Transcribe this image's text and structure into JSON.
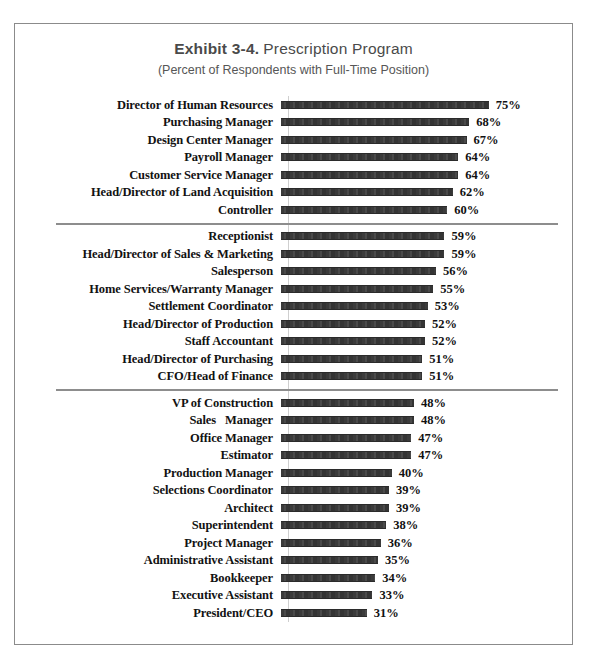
{
  "title": {
    "exhibit": "Exhibit 3-4.",
    "name": "Prescription Program",
    "subtitle": "(Percent of Respondents with Full-Time Position)"
  },
  "chart_data": {
    "type": "bar",
    "orientation": "horizontal",
    "subtitle": "(Percent of Respondents with Full-Time Position)",
    "xlabel": "",
    "ylabel": "",
    "xlim": [
      0,
      80
    ],
    "grid": false,
    "legend": "none",
    "value_suffix": "%",
    "group_separators_after": [
      6,
      15
    ],
    "categories": [
      "Director of Human Resources",
      "Purchasing Manager",
      "Design Center Manager",
      "Payroll Manager",
      "Customer Service Manager",
      "Head/Director of Land Acquisition",
      "Controller",
      "Receptionist",
      "Head/Director of Sales & Marketing",
      "Salesperson",
      "Home Services/Warranty Manager",
      "Settlement Coordinator",
      "Head/Director of Production",
      "Staff Accountant",
      "Head/Director of Purchasing",
      "CFO/Head of Finance",
      "VP of Construction",
      "Sales   Manager",
      "Office Manager",
      "Estimator",
      "Production Manager",
      "Selections Coordinator",
      "Architect",
      "Superintendent",
      "Project Manager",
      "Administrative Assistant",
      "Bookkeeper",
      "Executive Assistant",
      "President/CEO"
    ],
    "values": [
      75,
      68,
      67,
      64,
      64,
      62,
      60,
      59,
      59,
      56,
      55,
      53,
      52,
      52,
      51,
      51,
      48,
      48,
      47,
      47,
      40,
      39,
      39,
      38,
      36,
      35,
      34,
      33,
      31
    ],
    "value_labels": [
      "75%",
      "68%",
      "67%",
      "64%",
      "64%",
      "62%",
      "60%",
      "59%",
      "59%",
      "56%",
      "55%",
      "53%",
      "52%",
      "52%",
      "51%",
      "51%",
      "48%",
      "48%",
      "47%",
      "47%",
      "40%",
      "39%",
      "39%",
      "38%",
      "36%",
      "35%",
      "34%",
      "33%",
      "31%"
    ],
    "groups": [
      {
        "name": "group-1",
        "categories": [
          "Director of Human Resources",
          "Purchasing Manager",
          "Design Center Manager",
          "Payroll Manager",
          "Customer Service Manager",
          "Head/Director of Land Acquisition",
          "Controller"
        ],
        "values": [
          75,
          68,
          67,
          64,
          64,
          62,
          60
        ]
      },
      {
        "name": "group-2",
        "categories": [
          "Receptionist",
          "Head/Director of Sales & Marketing",
          "Salesperson",
          "Home Services/Warranty Manager",
          "Settlement Coordinator",
          "Head/Director of Production",
          "Staff Accountant",
          "Head/Director of Purchasing",
          "CFO/Head of Finance"
        ],
        "values": [
          59,
          59,
          56,
          55,
          53,
          52,
          52,
          51,
          51
        ]
      },
      {
        "name": "group-3",
        "categories": [
          "VP of Construction",
          "Sales   Manager",
          "Office Manager",
          "Estimator",
          "Production Manager",
          "Selections Coordinator",
          "Architect",
          "Superintendent",
          "Project Manager",
          "Administrative Assistant",
          "Bookkeeper",
          "Executive Assistant",
          "President/CEO"
        ],
        "values": [
          48,
          48,
          47,
          47,
          40,
          39,
          39,
          38,
          36,
          35,
          34,
          33,
          31
        ]
      }
    ]
  },
  "colors": {
    "bar_fill": "#3b3b3b",
    "frame_border": "#8b8b8b",
    "separator": "#8d8d8d",
    "title_text": "#4a4a4a",
    "label_text": "#121212"
  }
}
